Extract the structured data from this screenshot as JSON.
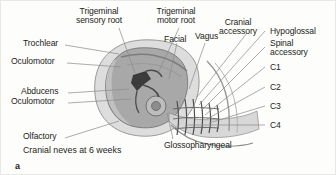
{
  "figure": {
    "panel_letter": "a",
    "caption": "Cranial neves at 6 weeks",
    "background_color": "#fdfdfc",
    "ink_color": "#231f20",
    "leader_color": "#8a8a8a",
    "embryo_fill_outer": "#cfcfcf",
    "embryo_fill_inner": "#9d9d9d",
    "embryo_stroke": "#6e6e6e"
  },
  "labels": {
    "left": [
      {
        "id": "trochlear",
        "text": "Trochlear",
        "x": 22,
        "y": 41
      },
      {
        "id": "oculomotor1",
        "text": "Oculomotor",
        "x": 10,
        "y": 59
      },
      {
        "id": "abducens",
        "text": "Abducens",
        "x": 20,
        "y": 89
      },
      {
        "id": "oculomotor2",
        "text": "Oculomotor",
        "x": 10,
        "y": 99
      },
      {
        "id": "olfactory",
        "text": "Olfactory",
        "x": 22,
        "y": 134
      }
    ],
    "top": [
      {
        "id": "trigeminal-sensory-root",
        "line1": "Trigeminal",
        "line2": "sensory root",
        "x": 91,
        "y": 8
      },
      {
        "id": "trigeminal-motor-root",
        "line1": "Trigeminal",
        "line2": "motor root",
        "x": 154,
        "y": 8
      },
      {
        "id": "cranial-accessory",
        "line1": "Cranial",
        "line2": "accessory",
        "x": 216,
        "y": 20
      },
      {
        "id": "facial",
        "text": "Facial",
        "x": 166,
        "y": 35
      },
      {
        "id": "vagus",
        "text": "Vagus",
        "x": 196,
        "y": 32
      }
    ],
    "right": [
      {
        "id": "hypoglossal",
        "text": "Hypoglossal",
        "x": 269,
        "y": 29
      },
      {
        "id": "spinal-accessory",
        "line1": "Spinal",
        "line2": "accessory",
        "x": 269,
        "y": 41
      },
      {
        "id": "c1",
        "text": "C1",
        "x": 269,
        "y": 66
      },
      {
        "id": "c2",
        "text": "C2",
        "x": 269,
        "y": 86
      },
      {
        "id": "c3",
        "text": "C3",
        "x": 269,
        "y": 105
      },
      {
        "id": "c4",
        "text": "C4",
        "x": 269,
        "y": 124
      }
    ],
    "bottom": [
      {
        "id": "glossopharyngeal",
        "text": "Glossopharyngeal",
        "x": 163,
        "y": 143
      }
    ]
  },
  "leader_lines": [
    {
      "id": "leader-trochlear",
      "points": "64,44 118,53"
    },
    {
      "id": "leader-oculomotor-upper",
      "points": "66,62 120,66"
    },
    {
      "id": "leader-abducens",
      "points": "67,92 128,88"
    },
    {
      "id": "leader-oculomotor-lower",
      "points": "67,102 130,98"
    },
    {
      "id": "leader-olfactory",
      "points": "64,137 118,120"
    },
    {
      "id": "leader-trigeminal-sensory",
      "points": "118,27 134,72"
    },
    {
      "id": "leader-trigeminal-motor",
      "points": "178,27 158,70"
    },
    {
      "id": "leader-facial",
      "points": "176,42 168,78"
    },
    {
      "id": "leader-vagus",
      "points": "204,42 188,88"
    },
    {
      "id": "leader-cranial-accessory",
      "points": "246,32 196,96"
    },
    {
      "id": "leader-hypoglossal",
      "points": "264,30 198,104"
    },
    {
      "id": "leader-spinal-accessory",
      "points": "264,46 200,110"
    },
    {
      "id": "leader-c1",
      "points": "264,66 204,114"
    },
    {
      "id": "leader-c2",
      "points": "264,86 206,118"
    },
    {
      "id": "leader-c3",
      "points": "264,105 208,122"
    },
    {
      "id": "leader-c4",
      "points": "264,124 186,124"
    },
    {
      "id": "leader-glossopharyngeal",
      "points": "172,138 166,112"
    }
  ]
}
